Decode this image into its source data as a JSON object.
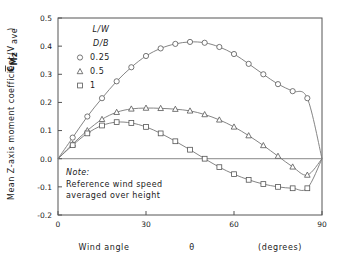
{
  "chart_data": {
    "type": "line",
    "title": "",
    "xlabel_parts": {
      "name": "Wind angle",
      "symbol": "θ",
      "units": "(degrees)"
    },
    "ylabel": "Mean Z-axis moment coefficient",
    "ylabel_symbol_main": "C",
    "ylabel_symbol_sub": "Mz",
    "ylabel_symbol_arg": "(V",
    "ylabel_symbol_argsub": "ave",
    "ylabel_symbol_close": ")",
    "xlim": [
      0,
      90
    ],
    "ylim": [
      -0.2,
      0.5
    ],
    "xticks": [
      0,
      30,
      60,
      90
    ],
    "xticklabels": [
      "0",
      "30",
      "60",
      "90"
    ],
    "yticks": [
      -0.2,
      -0.1,
      0.0,
      0.1,
      0.2,
      0.3,
      0.4,
      0.5
    ],
    "yticklabels": [
      "-0.2",
      "-0.1",
      "0.0",
      "0.1",
      "0.2",
      "0.3",
      "0.4",
      "0.5"
    ],
    "grid": false,
    "zero_line": true,
    "legend_position": "top-left-inside",
    "legend_header_numerator": "L/W",
    "legend_header_denominator": "D/B",
    "series": [
      {
        "name": "0.25",
        "marker": "circle",
        "x": [
          0,
          5,
          10,
          15,
          20,
          25,
          30,
          35,
          40,
          45,
          50,
          55,
          60,
          65,
          70,
          75,
          80,
          85,
          90
        ],
        "values": [
          0.0,
          0.075,
          0.15,
          0.215,
          0.275,
          0.325,
          0.365,
          0.392,
          0.408,
          0.415,
          0.412,
          0.397,
          0.372,
          0.337,
          0.3,
          0.265,
          0.24,
          0.215,
          0.0
        ]
      },
      {
        "name": "0.5",
        "marker": "triangle",
        "x": [
          0,
          5,
          10,
          15,
          20,
          25,
          30,
          35,
          40,
          45,
          50,
          55,
          60,
          65,
          70,
          75,
          80,
          85,
          90
        ],
        "values": [
          0.0,
          0.052,
          0.1,
          0.14,
          0.165,
          0.177,
          0.18,
          0.179,
          0.176,
          0.17,
          0.157,
          0.138,
          0.113,
          0.082,
          0.047,
          0.009,
          -0.029,
          -0.058,
          0.0
        ]
      },
      {
        "name": "1",
        "marker": "square",
        "x": [
          0,
          5,
          10,
          15,
          20,
          25,
          30,
          35,
          40,
          45,
          50,
          55,
          60,
          65,
          70,
          75,
          80,
          85,
          90
        ],
        "values": [
          0.0,
          0.048,
          0.09,
          0.118,
          0.13,
          0.127,
          0.113,
          0.09,
          0.062,
          0.032,
          0.0,
          -0.03,
          -0.055,
          -0.075,
          -0.09,
          -0.1,
          -0.105,
          -0.105,
          0.0
        ]
      }
    ],
    "note_heading": "Note:",
    "note_lines": [
      "Reference wind speed",
      "averaged over height"
    ]
  },
  "colors": {
    "axis": "#555555",
    "curve": "#777777",
    "marker_fill": "#ffffff",
    "text": "#1a1a1a",
    "background": "#ffffff",
    "zero_line": "#888888"
  }
}
